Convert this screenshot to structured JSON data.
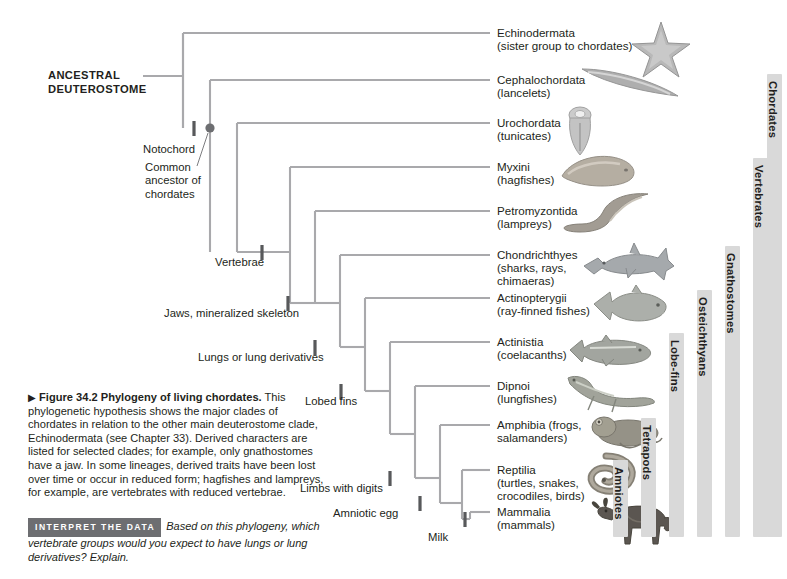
{
  "figure": {
    "root_label_line1": "ANCESTRAL",
    "root_label_line2": "DEUTEROSTOME",
    "caption_arrow": "▶",
    "caption_figure_number": "Figure 34.2",
    "caption_title": "Phylogeny of living chordates.",
    "caption_body": "This phylogenetic hypothesis shows the major clades of chordates in relation to the other main deuterostome clade, Echinodermata (see Chapter 33). Derived characters are listed for selected clades; for example, only gnathostomes have a jaw. In some lineages, derived traits have been lost over time or occur in reduced form; hagfishes and lampreys, for example, are vertebrates with reduced vertebrae.",
    "interpret_badge": "INTERPRET THE DATA",
    "interpret_text": "Based on this phylogeny, which vertebrate groups would you expect to have lungs or lung derivatives? Explain."
  },
  "node_annotations": {
    "common_ancestor": "Common ancestor of chordates"
  },
  "traits": [
    {
      "label": "Notochord"
    },
    {
      "label": "Vertebrae"
    },
    {
      "label": "Jaws, mineralized skeleton"
    },
    {
      "label": "Lungs or lung derivatives"
    },
    {
      "label": "Lobed fins"
    },
    {
      "label": "Limbs with digits"
    },
    {
      "label": "Amniotic egg"
    },
    {
      "label": "Milk"
    }
  ],
  "taxa": [
    {
      "name": "Echinodermata",
      "common": "(sister group to chordates)",
      "common2": "",
      "common3": "",
      "icon": "sea-star-icon"
    },
    {
      "name": "Cephalochordata",
      "common": "(lancelets)",
      "common2": "",
      "common3": "",
      "icon": "lancelet-icon"
    },
    {
      "name": "Urochordata",
      "common": "(tunicates)",
      "common2": "",
      "common3": "",
      "icon": "tunicate-icon"
    },
    {
      "name": "Myxini",
      "common": "(hagfishes)",
      "common2": "",
      "common3": "",
      "icon": "hagfish-icon"
    },
    {
      "name": "Petromyzontida",
      "common": "(lampreys)",
      "common2": "",
      "common3": "",
      "icon": "lamprey-icon"
    },
    {
      "name": "Chondrichthyes",
      "common": "(sharks, rays,",
      "common2": " chimaeras)",
      "common3": "",
      "icon": "shark-icon"
    },
    {
      "name": "Actinopterygii",
      "common": "(ray-finned fishes)",
      "common2": "",
      "common3": "",
      "icon": "ray-finned-fish-icon"
    },
    {
      "name": "Actinistia",
      "common": "(coelacanths)",
      "common2": "",
      "common3": "",
      "icon": "coelacanth-icon"
    },
    {
      "name": "Dipnoi",
      "common": "(lungfishes)",
      "common2": "",
      "common3": "",
      "icon": "lungfish-icon"
    },
    {
      "name": "Amphibia (frogs,",
      "common": "salamanders)",
      "common2": "",
      "common3": "",
      "icon": "frog-icon"
    },
    {
      "name": "Reptilia",
      "common": "(turtles, snakes,",
      "common2": "crocodiles, birds)",
      "common3": "",
      "icon": "snake-icon"
    },
    {
      "name": "Mammalia",
      "common": "(mammals)",
      "common2": "",
      "common3": "",
      "icon": "wildebeest-icon"
    }
  ],
  "clade_bars": [
    {
      "label": "Amniotes"
    },
    {
      "label": "Tetrapods"
    },
    {
      "label": "Lobe-fins"
    },
    {
      "label": "Osteichthyans"
    },
    {
      "label": "Gnathostomes"
    },
    {
      "label": "Vertebrates"
    },
    {
      "label": "Chordates"
    }
  ],
  "colors": {
    "branch": "#a9a9ac",
    "tick": "#58595b",
    "clade_bar": "#d9d9d9",
    "badge": "#6d6e71",
    "text": "#231f20",
    "page": "#ffffff"
  }
}
